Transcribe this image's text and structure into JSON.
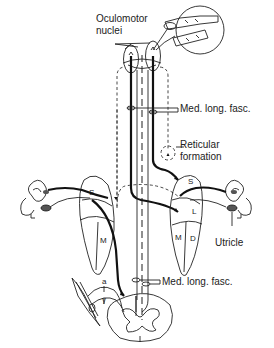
{
  "labels": {
    "oculomotor_line1": "Oculomotor",
    "oculomotor_line2": "nuclei",
    "mlf_upper": "Med. long. fasc.",
    "reticular_line1": "Reticular",
    "reticular_line2": "formation",
    "utricle": "Utricle",
    "mlf_lower": "Med. long. fasc."
  },
  "nuclei_letters": {
    "left_s": "S",
    "left_m": "M",
    "right_s": "S",
    "right_l": "L",
    "right_m": "M",
    "right_d": "D"
  },
  "spinal_labels": {
    "alpha": "a",
    "gamma": "γ"
  },
  "colors": {
    "line": "#111111",
    "background": "#ffffff",
    "otolith_fill": "#555555"
  }
}
